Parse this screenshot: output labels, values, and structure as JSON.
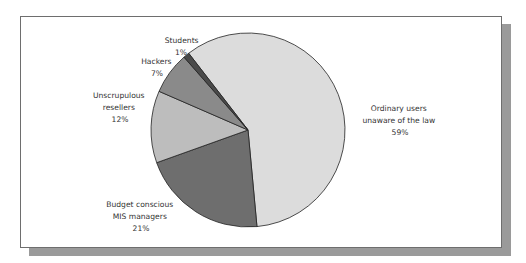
{
  "chart_data": {
    "type": "pie",
    "title": "",
    "start_angle_deg": -37.7,
    "direction": "clockwise",
    "slices": [
      {
        "label_lines": [
          "Ordinary users",
          "unaware of the law"
        ],
        "value": 59,
        "pct_label": "59%",
        "color": "#dcdcdc"
      },
      {
        "label_lines": [
          "Budget conscious",
          "MIS managers"
        ],
        "value": 21,
        "pct_label": "21%",
        "color": "#6e6e6e"
      },
      {
        "label_lines": [
          "Unscrupulous",
          "resellers"
        ],
        "value": 12,
        "pct_label": "12%",
        "color": "#bdbdbd"
      },
      {
        "label_lines": [
          "Hackers"
        ],
        "value": 7,
        "pct_label": "7%",
        "color": "#8a8a8a"
      },
      {
        "label_lines": [
          "Students"
        ],
        "value": 1,
        "pct_label": "1%",
        "color": "#4a4a4a"
      }
    ]
  }
}
